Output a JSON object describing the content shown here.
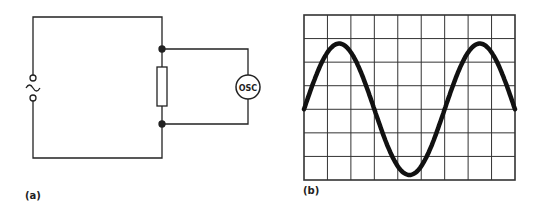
{
  "figure_a": {
    "label": "(a)",
    "meter_label": "OSC",
    "source_symbol": "~",
    "components": [
      "ac-source",
      "resistor",
      "oscilloscope"
    ]
  },
  "figure_b": {
    "label": "(b)",
    "grid": {
      "columns": 9,
      "rows": 7
    },
    "waveform": "sine",
    "cycles_shown": 1.5
  }
}
